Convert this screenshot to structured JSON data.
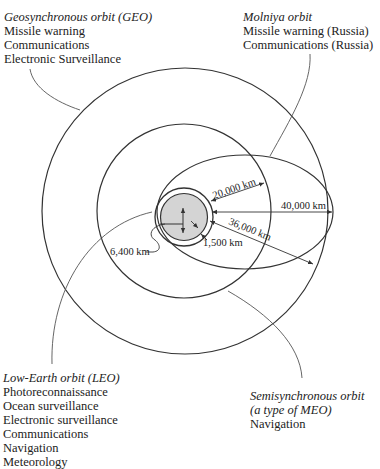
{
  "labels": {
    "geo": {
      "title": "Geosynchronous orbit (GEO)",
      "items": [
        "Missile warning",
        "Communications",
        "Electronic Surveillance"
      ]
    },
    "molniya": {
      "title": "Molniya orbit",
      "items": [
        "Missile warning (Russia)",
        "Communications (Russia)"
      ]
    },
    "leo": {
      "title": "Low-Earth orbit (LEO)",
      "items": [
        "Photoreconnaissance",
        "Ocean surveillance",
        "Electronic surveillance",
        "Communications",
        "Navigation",
        "Meteorology"
      ]
    },
    "meo": {
      "title_line1": "Semisynchronous orbit",
      "title_line2": "(a type of MEO)",
      "items": [
        "Navigation"
      ]
    }
  },
  "dimensions": {
    "earth_radius": "6,400 km",
    "leo_altitude": "1,500 km",
    "meo_altitude": "20,000 km",
    "geo_altitude": "36,000 km",
    "molniya_apogee": "40,000 km"
  },
  "colors": {
    "line": "#333333",
    "earth_fill": "#d4d4d4"
  }
}
